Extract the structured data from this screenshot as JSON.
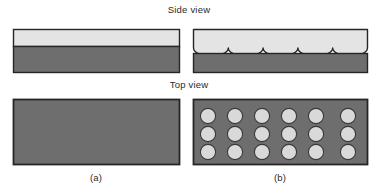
{
  "figure": {
    "title_side": "Side view",
    "title_top": "Top view",
    "label_a": "(a)",
    "label_b": "(b)",
    "colors": {
      "background": "#ffffff",
      "substrate_dark": "#6e6e6e",
      "coating_light": "#e2e2e2",
      "outline": "#262626",
      "dimple_fill": "#d9d9d9",
      "dimple_outline": "#3a3a3a"
    },
    "panel_a": {
      "side_view": {
        "description": "flat light coating layer over dark substrate",
        "layers": [
          {
            "name": "coating",
            "tone": "light"
          },
          {
            "name": "substrate",
            "tone": "dark"
          }
        ]
      },
      "top_view": {
        "description": "plain dark rectangle, no features",
        "feature_count": 0
      }
    },
    "panel_b": {
      "side_view": {
        "description": "light coating with scalloped underside separated from dark substrate",
        "scallop_count": 5,
        "layers": [
          {
            "name": "coating",
            "tone": "light"
          },
          {
            "name": "substrate",
            "tone": "dark"
          }
        ]
      },
      "top_view": {
        "description": "dark rectangle patterned with light circular dimples",
        "columns": 6,
        "rows": 3,
        "feature_count": 18
      }
    }
  }
}
